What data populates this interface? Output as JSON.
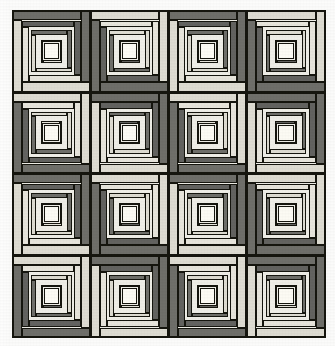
{
  "image": {
    "title": "Log Cabin quilt, 4 x 4 block layout",
    "subject": "patchwork quilt photograph",
    "width": 335,
    "height": 346,
    "background_color": "#ffffff",
    "paper_color": "#fbfbfa"
  },
  "quilt": {
    "name": "log-cabin-quilt",
    "pattern_name": "Log Cabin",
    "rows": 4,
    "columns": 4,
    "block_count": 16,
    "rings_per_block": 4,
    "bounds": {
      "left": 12,
      "top": 10,
      "width": 314,
      "height": 328
    },
    "outline_color": "#16160f",
    "sashing_color": "#efefe9"
  },
  "palette": {
    "dark_strip": "#6f6f6a",
    "dark_strip_alt": "#636360",
    "light_strip": "#dedcd2",
    "light_strip_alt": "#e7e5dc",
    "center_square": "#fcfbf4",
    "seam_line": "#16160f",
    "block_ground": "#efeee7"
  },
  "blocks": [
    {
      "row": 0,
      "col": 0,
      "orientation": "dark-top-right",
      "label": "block-r0-c0"
    },
    {
      "row": 0,
      "col": 1,
      "orientation": "light-top-right",
      "label": "block-r0-c1"
    },
    {
      "row": 0,
      "col": 2,
      "orientation": "dark-top-right",
      "label": "block-r0-c2"
    },
    {
      "row": 0,
      "col": 3,
      "orientation": "light-top-right",
      "label": "block-r0-c3"
    },
    {
      "row": 1,
      "col": 0,
      "orientation": "light-top-right",
      "label": "block-r1-c0"
    },
    {
      "row": 1,
      "col": 1,
      "orientation": "dark-top-right",
      "label": "block-r1-c1"
    },
    {
      "row": 1,
      "col": 2,
      "orientation": "light-top-right",
      "label": "block-r1-c2"
    },
    {
      "row": 1,
      "col": 3,
      "orientation": "dark-top-right",
      "label": "block-r1-c3"
    },
    {
      "row": 2,
      "col": 0,
      "orientation": "dark-top-right",
      "label": "block-r2-c0"
    },
    {
      "row": 2,
      "col": 1,
      "orientation": "light-top-right",
      "label": "block-r2-c1"
    },
    {
      "row": 2,
      "col": 2,
      "orientation": "dark-top-right",
      "label": "block-r2-c2"
    },
    {
      "row": 2,
      "col": 3,
      "orientation": "light-top-right",
      "label": "block-r2-c3"
    },
    {
      "row": 3,
      "col": 0,
      "orientation": "light-top-right",
      "label": "block-r3-c0"
    },
    {
      "row": 3,
      "col": 1,
      "orientation": "dark-top-right",
      "label": "block-r3-c1"
    },
    {
      "row": 3,
      "col": 2,
      "orientation": "light-top-right",
      "label": "block-r3-c2"
    },
    {
      "row": 3,
      "col": 3,
      "orientation": "dark-top-right",
      "label": "block-r3-c3"
    }
  ],
  "ring_geometry": [
    {
      "index": 0,
      "inset_percent": 0,
      "strip_percent": 11.5
    },
    {
      "index": 1,
      "inset_percent": 12,
      "strip_percent": 11.0
    },
    {
      "index": 2,
      "inset_percent": 24,
      "strip_percent": 11.0
    },
    {
      "index": 3,
      "inset_percent": 36,
      "strip_percent": 11.0
    }
  ],
  "center": {
    "inset_percent": 40,
    "size_percent": 20
  }
}
